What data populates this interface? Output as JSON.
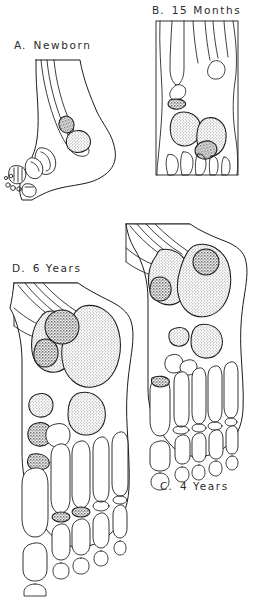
{
  "figure": {
    "type": "anatomical-illustration",
    "background_color": "#ffffff",
    "line_color": "#1c1c1c",
    "ossified_fill_color": "#bdbdbd",
    "ossified_dark_fill_color": "#9a9a9a",
    "cartilage_fill_color": "#ffffff"
  },
  "panels": [
    {
      "id": "A",
      "letter": "A.",
      "age_label": "Newborn",
      "view": "lateral",
      "ossified_centers_visible": 2,
      "label_position": {
        "x": 14,
        "y": 40
      }
    },
    {
      "id": "B",
      "letter": "B.",
      "age_label": "15 Months",
      "view": "dorsal-plantar",
      "ossified_centers_visible": 4,
      "label_position": {
        "x": 152,
        "y": 5
      }
    },
    {
      "id": "C",
      "letter": "C.",
      "age_label": "4 Years",
      "view": "dorsal-plantar",
      "ossified_centers_visible": 7,
      "label_position": {
        "x": 160,
        "y": 481
      }
    },
    {
      "id": "D",
      "letter": "D.",
      "age_label": "6 Years",
      "view": "dorsal-plantar",
      "ossified_centers_visible": 9,
      "label_position": {
        "x": 12,
        "y": 263
      }
    }
  ]
}
